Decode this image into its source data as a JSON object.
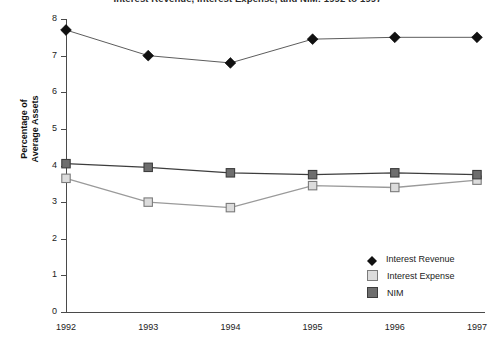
{
  "chart_data": {
    "type": "line",
    "title": "Interest Revenue, Interest Expense, and NIM: 1992 to 1997",
    "title_clipped": true,
    "xlabel": "",
    "ylabel": "Percentage of Average Assets",
    "ylabel_line1": "Percentage of",
    "ylabel_line2": "Average Assets",
    "categories": [
      "1992",
      "1993",
      "1994",
      "1995",
      "1996",
      "1997"
    ],
    "ylim": [
      0,
      8
    ],
    "yticks": [
      0,
      1,
      2,
      3,
      4,
      5,
      6,
      7,
      8
    ],
    "ytick_labels": [
      "0",
      "1",
      "2",
      "3",
      "4",
      "5",
      "6",
      "7",
      "8"
    ],
    "grid": false,
    "legend_position": "bottom-right",
    "series": [
      {
        "name": "Interest Revenue",
        "marker": "diamond",
        "color": "#111111",
        "values": [
          7.7,
          7.0,
          6.8,
          7.45,
          7.5,
          7.5
        ]
      },
      {
        "name": "Interest Expense",
        "marker": "square",
        "color": "#dcdcdc",
        "edge_color": "#7b7b7b",
        "values": [
          3.65,
          3.0,
          2.85,
          3.45,
          3.4,
          3.6
        ]
      },
      {
        "name": "NIM",
        "marker": "square",
        "color": "#6e6e6e",
        "edge_color": "#3d3d3d",
        "values": [
          4.05,
          3.95,
          3.8,
          3.75,
          3.8,
          3.75
        ]
      }
    ]
  },
  "legend": {
    "items": [
      {
        "label": "Interest Revenue"
      },
      {
        "label": "Interest Expense"
      },
      {
        "label": "NIM"
      }
    ]
  }
}
